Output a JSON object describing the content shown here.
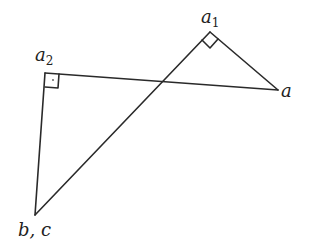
{
  "diagram": {
    "type": "geometry",
    "stroke_color": "#2a2a2a",
    "vertices": {
      "a1": {
        "x": 210,
        "y": 32
      },
      "a": {
        "x": 278,
        "y": 90
      },
      "a2": {
        "x": 45,
        "y": 73
      },
      "bc": {
        "x": 35,
        "y": 215
      }
    },
    "segments": [
      {
        "from": "bc",
        "to": "a1"
      },
      {
        "from": "a1",
        "to": "a"
      },
      {
        "from": "a2",
        "to": "a"
      },
      {
        "from": "a2",
        "to": "bc"
      }
    ],
    "right_angles": [
      {
        "at": "a1",
        "style": "diamond"
      },
      {
        "at": "a2",
        "style": "square"
      }
    ],
    "labels": {
      "a1": {
        "base": "a",
        "sub": "1"
      },
      "a": {
        "base": "a",
        "sub": ""
      },
      "a2": {
        "base": "a",
        "sub": "2"
      },
      "bc": {
        "text": "b, c"
      }
    }
  }
}
